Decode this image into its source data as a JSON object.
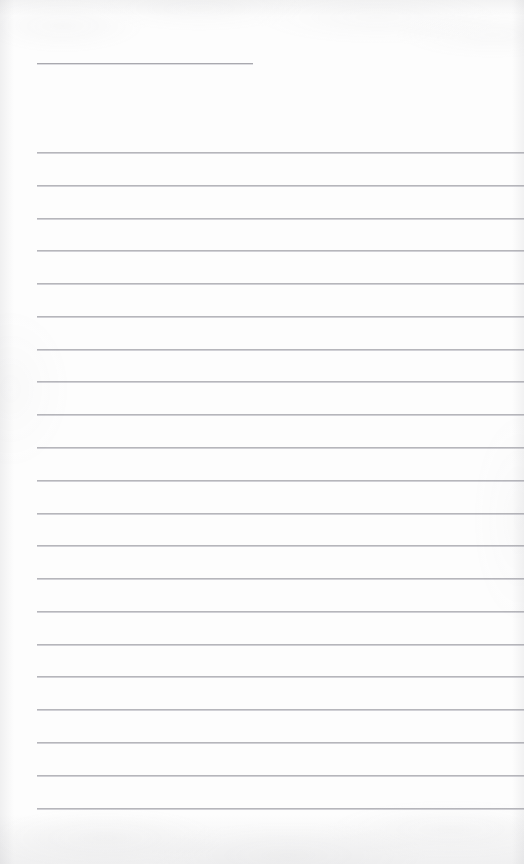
{
  "document": {
    "kind": "scanned-lined-page",
    "title": "",
    "body_text": "",
    "visible_text": [],
    "page_number": "",
    "orientation": "portrait"
  },
  "canvas": {
    "width": 524,
    "height": 864
  },
  "colors": {
    "paper": "#fdfdfd",
    "rule": "#b6b6bb",
    "rule_highlight": "#d0d0d5",
    "title_rule": "#a9a9af",
    "edge_shadow": "rgba(150,150,156,0.13)"
  },
  "layout": {
    "left_margin_x": 37,
    "right_edge_x": 524,
    "rule_thickness": 1,
    "rule_spacing": 32.8,
    "first_rule_y": 152,
    "last_rule_y": 808,
    "full_rule_count": 21
  },
  "title_rule": {
    "label": "title-rule",
    "x": 37,
    "y": 63,
    "width": 216,
    "end_x": 253
  },
  "rules": [
    {
      "index": 1,
      "y": 152,
      "x": 37,
      "width": 487
    },
    {
      "index": 2,
      "y": 185,
      "x": 37,
      "width": 487
    },
    {
      "index": 3,
      "y": 218,
      "x": 37,
      "width": 487
    },
    {
      "index": 4,
      "y": 250,
      "x": 37,
      "width": 487
    },
    {
      "index": 5,
      "y": 283,
      "x": 37,
      "width": 487
    },
    {
      "index": 6,
      "y": 316,
      "x": 37,
      "width": 487
    },
    {
      "index": 7,
      "y": 349,
      "x": 37,
      "width": 487
    },
    {
      "index": 8,
      "y": 381,
      "x": 37,
      "width": 487
    },
    {
      "index": 9,
      "y": 414,
      "x": 37,
      "width": 487
    },
    {
      "index": 10,
      "y": 447,
      "x": 37,
      "width": 487
    },
    {
      "index": 11,
      "y": 480,
      "x": 37,
      "width": 487
    },
    {
      "index": 12,
      "y": 513,
      "x": 37,
      "width": 487
    },
    {
      "index": 13,
      "y": 545,
      "x": 37,
      "width": 487
    },
    {
      "index": 14,
      "y": 578,
      "x": 37,
      "width": 487
    },
    {
      "index": 15,
      "y": 611,
      "x": 37,
      "width": 487
    },
    {
      "index": 16,
      "y": 644,
      "x": 37,
      "width": 487
    },
    {
      "index": 17,
      "y": 676,
      "x": 37,
      "width": 487
    },
    {
      "index": 18,
      "y": 709,
      "x": 37,
      "width": 487
    },
    {
      "index": 19,
      "y": 742,
      "x": 37,
      "width": 487
    },
    {
      "index": 20,
      "y": 775,
      "x": 37,
      "width": 487
    },
    {
      "index": 21,
      "y": 808,
      "x": 37,
      "width": 487
    }
  ]
}
